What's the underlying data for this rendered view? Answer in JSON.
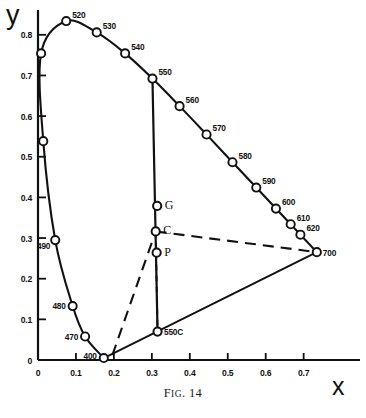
{
  "figure": {
    "caption_prefix": "F",
    "caption_smallcaps": "IG",
    "caption_suffix": ". 14",
    "caption_full": "FIG. 14"
  },
  "axes": {
    "x_label": "x",
    "y_label": "y",
    "x_ticks": [
      "0",
      "0.1",
      "0.2",
      "0.3",
      "0.4",
      "0.5",
      "0.6",
      "0.7"
    ],
    "x_tick_values": [
      0,
      0.1,
      0.2,
      0.3,
      0.4,
      0.5,
      0.6,
      0.7
    ],
    "y_ticks": [
      "0",
      "0.1",
      "0.2",
      "0.3",
      "0.4",
      "0.5",
      "0.6",
      "0.7",
      "0.8"
    ],
    "y_tick_values": [
      0,
      0.1,
      0.2,
      0.3,
      0.4,
      0.5,
      0.6,
      0.7,
      0.8
    ],
    "xlim": [
      0,
      0.78
    ],
    "ylim": [
      0,
      0.87
    ]
  },
  "chart_data": {
    "type": "scatter",
    "title": "FIG. 14",
    "xlabel": "x",
    "ylabel": "y",
    "xlim": [
      0,
      0.78
    ],
    "ylim": [
      0,
      0.87
    ],
    "grid": false,
    "legend": "none",
    "spectral_locus": {
      "name": "spectral locus",
      "points": [
        {
          "label": "400",
          "x": 0.1733,
          "y": 0.0048
        },
        {
          "label": "470",
          "x": 0.1241,
          "y": 0.0578
        },
        {
          "label": "480",
          "x": 0.0913,
          "y": 0.1327
        },
        {
          "label": "490",
          "x": 0.0454,
          "y": 0.295
        },
        {
          "label": "",
          "x": 0.0139,
          "y": 0.5384
        },
        {
          "label": "",
          "x": 0.0082,
          "y": 0.7543
        },
        {
          "label": "520",
          "x": 0.0743,
          "y": 0.8338
        },
        {
          "label": "530",
          "x": 0.1547,
          "y": 0.8059
        },
        {
          "label": "540",
          "x": 0.2296,
          "y": 0.7543
        },
        {
          "label": "550",
          "x": 0.3016,
          "y": 0.6923
        },
        {
          "label": "560",
          "x": 0.3731,
          "y": 0.6245
        },
        {
          "label": "570",
          "x": 0.4441,
          "y": 0.5547
        },
        {
          "label": "580",
          "x": 0.5125,
          "y": 0.4866
        },
        {
          "label": "590",
          "x": 0.5752,
          "y": 0.4242
        },
        {
          "label": "600",
          "x": 0.627,
          "y": 0.3725
        },
        {
          "label": "610",
          "x": 0.6658,
          "y": 0.334
        },
        {
          "label": "620",
          "x": 0.6915,
          "y": 0.3083
        },
        {
          "label": "700",
          "x": 0.7347,
          "y": 0.2653
        }
      ]
    },
    "marked_points": [
      {
        "label": "G",
        "x": 0.314,
        "y": 0.379
      },
      {
        "label": "C",
        "x": 0.3101,
        "y": 0.3162
      },
      {
        "label": "P",
        "x": 0.3126,
        "y": 0.264
      },
      {
        "label": "550C",
        "x": 0.315,
        "y": 0.07
      }
    ],
    "lines": [
      {
        "name": "purple-line",
        "style": "solid",
        "from": "400",
        "to": "700"
      },
      {
        "name": "vertical-550-line",
        "style": "solid",
        "from": "550",
        "to": "550C"
      },
      {
        "name": "dominant-wavelength-dashed",
        "style": "dashed",
        "from": "400-region",
        "to": "C"
      },
      {
        "name": "C-to-700-dashed",
        "style": "dashed",
        "from": "C",
        "to": "700"
      },
      {
        "name": "C-to-550C-dashed",
        "style": "dashed",
        "from": "C",
        "to": "550C"
      }
    ]
  }
}
